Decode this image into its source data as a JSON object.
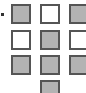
{
  "grid": {
    "marker": "bullet",
    "cells": [
      {
        "row": 0,
        "col": 0,
        "state": "filled"
      },
      {
        "row": 0,
        "col": 1,
        "state": "empty"
      },
      {
        "row": 0,
        "col": 2,
        "state": "filled"
      },
      {
        "row": 1,
        "col": 0,
        "state": "empty"
      },
      {
        "row": 1,
        "col": 1,
        "state": "filled"
      },
      {
        "row": 1,
        "col": 2,
        "state": "empty"
      },
      {
        "row": 2,
        "col": 0,
        "state": "filled"
      },
      {
        "row": 2,
        "col": 1,
        "state": "filled"
      },
      {
        "row": 2,
        "col": 2,
        "state": "filled"
      },
      {
        "row": 3,
        "col": 1,
        "state": "filled"
      }
    ],
    "colors": {
      "filled": "#b3b3b3",
      "empty": "#ffffff",
      "border": "#555555"
    }
  }
}
